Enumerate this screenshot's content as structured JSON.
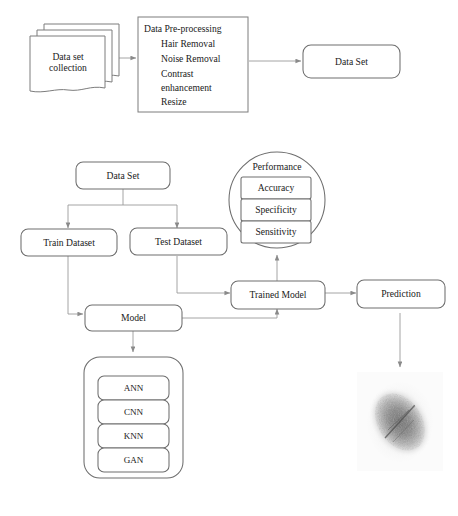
{
  "diagram": {
    "stage1": {
      "dataset_collection": {
        "label": "Data set\ncollection",
        "shape": "stacked-documents"
      },
      "preprocessing": {
        "heading": "Data Pre-processing",
        "steps": [
          "Hair Removal",
          "Noise Removal",
          "Contrast",
          "enhancement",
          "Resize"
        ]
      },
      "dataset_out": {
        "label": "Data Set"
      }
    },
    "stage2": {
      "dataset": {
        "label": "Data Set"
      },
      "train_dataset": {
        "label": "Train Dataset"
      },
      "test_dataset": {
        "label": "Test Dataset"
      },
      "model": {
        "label": "Model"
      },
      "trained_model": {
        "label": "Trained Model"
      },
      "prediction": {
        "label": "Prediction"
      },
      "performance": {
        "label": "Performance",
        "metrics": [
          "Accuracy",
          "Specificity",
          "Sensitivity"
        ]
      },
      "algorithms": [
        "ANN",
        "CNN",
        "KNN",
        "GAN"
      ],
      "output_image": {
        "alt": "dermoscopic skin lesion image"
      }
    },
    "colors": {
      "stroke": "#7d7d7d",
      "connector": "#9a9a9a",
      "text": "#1a1a1a",
      "background": "#ffffff"
    }
  }
}
